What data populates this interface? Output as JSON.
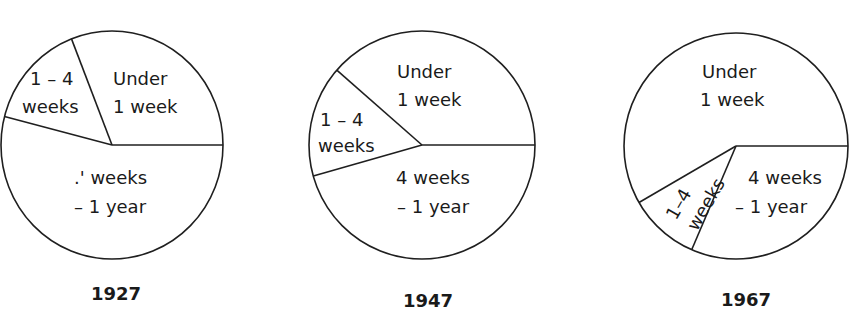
{
  "chart_data": {
    "type": "pie",
    "title": "",
    "charts": [
      {
        "year": "1927",
        "center": [
          112,
          145
        ],
        "radius": [
          111,
          114
        ],
        "slices": [
          {
            "label": "4 weeks – 1 year",
            "display_lines": [
              ".' weeks",
              "– 1 year"
            ],
            "value": 54.0,
            "start_angle": 0,
            "end_angle": 194.4
          },
          {
            "label": "1 – 4 weeks",
            "display_lines": [
              "1 – 4",
              "weeks"
            ],
            "value": 15.1,
            "start_angle": 194.4,
            "end_angle": 248.6
          },
          {
            "label": "Under 1 week",
            "display_lines": [
              "Under",
              "1 week"
            ],
            "value": 30.9,
            "start_angle": 248.6,
            "end_angle": 360
          }
        ]
      },
      {
        "year": "1947",
        "center": [
          422,
          145
        ],
        "radius": [
          113,
          114
        ],
        "slices": [
          {
            "label": "4 weeks – 1 year",
            "display_lines": [
              "4 weeks",
              "– 1 year"
            ],
            "value": 45.6,
            "start_angle": 0,
            "end_angle": 164.2
          },
          {
            "label": "1 – 4 weeks",
            "display_lines": [
              "1 – 4",
              "weeks"
            ],
            "value": 15.8,
            "start_angle": 164.2,
            "end_angle": 221.1
          },
          {
            "label": "Under 1 week",
            "display_lines": [
              "Under",
              "1 week"
            ],
            "value": 38.6,
            "start_angle": 221.1,
            "end_angle": 360
          }
        ]
      },
      {
        "year": "1967",
        "center": [
          736,
          146
        ],
        "radius": [
          112,
          113
        ],
        "slices": [
          {
            "label": "4 weeks – 1 year",
            "display_lines": [
              "4 weeks",
              "– 1 year"
            ],
            "value": 31.5,
            "start_angle": 0,
            "end_angle": 113.3
          },
          {
            "label": "1 – 4 weeks",
            "display_lines": [
              "1–4",
              "weeks"
            ],
            "value": 10.2,
            "start_angle": 113.3,
            "end_angle": 150.0
          },
          {
            "label": "Under 1 week",
            "display_lines": [
              "Under",
              "1 week"
            ],
            "value": 58.3,
            "start_angle": 150.0,
            "end_angle": 360
          }
        ]
      }
    ],
    "units": "percent (estimated from slice angles)",
    "legend": "none (labels inside slices)"
  },
  "pies": {
    "p1927": {
      "year": "1927",
      "under_1": "Under",
      "under_2": "1 week",
      "onefour_1": "1 – 4",
      "onefour_2": "weeks",
      "long_1": ".' weeks",
      "long_2": "– 1 year"
    },
    "p1947": {
      "year": "1947",
      "under_1": "Under",
      "under_2": "1 week",
      "onefour_1": "1 – 4",
      "onefour_2": "weeks",
      "long_1": "4 weeks",
      "long_2": "– 1 year"
    },
    "p1967": {
      "year": "1967",
      "under_1": "Under",
      "under_2": "1 week",
      "onefour_1": "1–4",
      "onefour_2": "weeks",
      "long_1": "4 weeks",
      "long_2": "– 1 year"
    }
  },
  "colors": {
    "line": "#1f1f1f",
    "fill": "#ffffff",
    "text": "#1a1a1a"
  }
}
